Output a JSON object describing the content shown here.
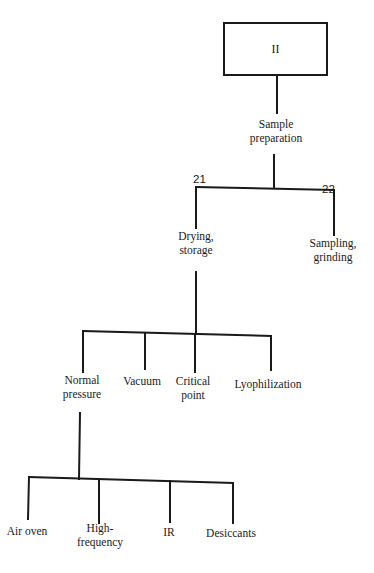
{
  "root": {
    "label": "II"
  },
  "level1": {
    "label": "Sample\npreparation"
  },
  "level2": [
    {
      "number": "21",
      "label": "Drying,\nstorage"
    },
    {
      "number": "22",
      "label": "Sampling,\ngrinding"
    }
  ],
  "level3": [
    {
      "label": "Normal\npressure"
    },
    {
      "label": "Vacuum"
    },
    {
      "label": "Critical\npoint"
    },
    {
      "label": "Lyophilization"
    }
  ],
  "level4": [
    {
      "label": "Air oven"
    },
    {
      "label": "High-\nfrequency"
    },
    {
      "label": "IR"
    },
    {
      "label": "Desiccants"
    }
  ],
  "colors": {
    "line": "#1a1a1a",
    "background": "#ffffff"
  }
}
